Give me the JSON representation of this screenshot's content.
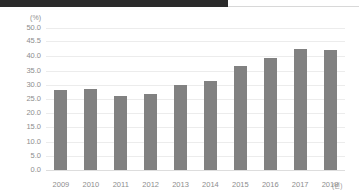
{
  "decor": {
    "top_band_color": "#2b2b2b"
  },
  "chart_data": {
    "type": "bar",
    "title": "",
    "xlabel": "(년)",
    "ylabel": "(%)",
    "categories": [
      "2009",
      "2010",
      "2011",
      "2012",
      "2013",
      "2014",
      "2015",
      "2016",
      "2017",
      "2018"
    ],
    "values": [
      28.0,
      28.5,
      26.0,
      26.8,
      30.1,
      31.4,
      36.8,
      39.6,
      42.5,
      42.4
    ],
    "ylim": [
      0.0,
      50.0
    ],
    "yticks": [
      0.0,
      5.0,
      10.0,
      15.0,
      20.0,
      25.0,
      30.0,
      35.0,
      40.0,
      45.5,
      50.0
    ],
    "ytick_labels": [
      "0.0",
      "5.0",
      "10.0",
      "15.0",
      "20.0",
      "25.0",
      "30.0",
      "35.0",
      "40.0",
      "45.5",
      "50.0"
    ],
    "grid": true,
    "legend": false,
    "bar_color": "#818181"
  }
}
